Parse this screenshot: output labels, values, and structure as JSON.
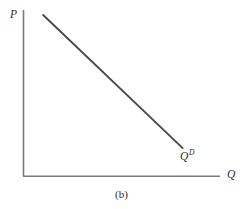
{
  "figure": {
    "caption": "(b)",
    "background_color": "#ffffff",
    "axis_color": "#7a7a7a",
    "curve_color": "#4a4a4a",
    "text_color": "#2b2b2b"
  },
  "axes": {
    "y": {
      "label": "P",
      "name": "price-axis"
    },
    "x": {
      "label": "Q",
      "name": "quantity-axis"
    }
  },
  "curve": {
    "label_base": "Q",
    "label_superscript": "D",
    "name": "demand-curve"
  },
  "chart_data": {
    "type": "line",
    "title": "",
    "subtitle": "",
    "xlabel": "Q",
    "ylabel": "P",
    "grid": false,
    "legend": null,
    "axis_ticks": {
      "x": [],
      "y": []
    },
    "xlim": [
      0,
      100
    ],
    "ylim": [
      0,
      100
    ],
    "series": [
      {
        "name": "Q^D",
        "label": "Q",
        "label_superscript": "D",
        "style": "solid",
        "color": "#4a4a4a",
        "x": [
          10.0,
          81.0
        ],
        "y": [
          97.0,
          16.9
        ],
        "points": [
          {
            "x": 10.0,
            "y": 97.0
          },
          {
            "x": 81.0,
            "y": 16.9
          }
        ],
        "annotation": "Q^D"
      }
    ],
    "annotations": [
      {
        "text": "Q^D",
        "x": 84.0,
        "y": 12.0
      },
      {
        "text": "(b)",
        "x": 50.0,
        "y": -12.0
      }
    ]
  }
}
